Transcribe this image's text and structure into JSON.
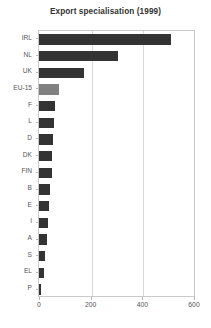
{
  "chart_data": {
    "type": "bar",
    "orientation": "horizontal",
    "title": "Export specialisation (1999)",
    "xlabel": "",
    "ylabel": "",
    "xlim": [
      0,
      600
    ],
    "ylim": null,
    "grid": true,
    "legend": null,
    "xticks": [
      "0",
      "200",
      "400",
      "600"
    ],
    "xtick_values": [
      0,
      200,
      400,
      600
    ],
    "categories": [
      "IRL",
      "NL",
      "UK",
      "EU-15",
      "F",
      "L",
      "D",
      "DK",
      "FIN",
      "B",
      "E",
      "I",
      "A",
      "S",
      "EL",
      "P"
    ],
    "values": [
      512,
      306,
      176,
      76,
      61,
      59,
      55,
      49,
      49,
      44,
      40,
      33,
      32,
      23,
      18,
      5
    ],
    "bar_colors": [
      "#333333",
      "#333333",
      "#333333",
      "#808080",
      "#333333",
      "#333333",
      "#333333",
      "#333333",
      "#333333",
      "#333333",
      "#333333",
      "#333333",
      "#333333",
      "#333333",
      "#333333",
      "#333333"
    ],
    "highlight_category": "EU-15",
    "colors": {
      "bar": "#333333",
      "bar_highlight": "#808080",
      "grid": "#d8d8d8",
      "frame": "#c9c9c9",
      "text": "#555555",
      "title": "#333333",
      "background": "#ffffff"
    }
  }
}
